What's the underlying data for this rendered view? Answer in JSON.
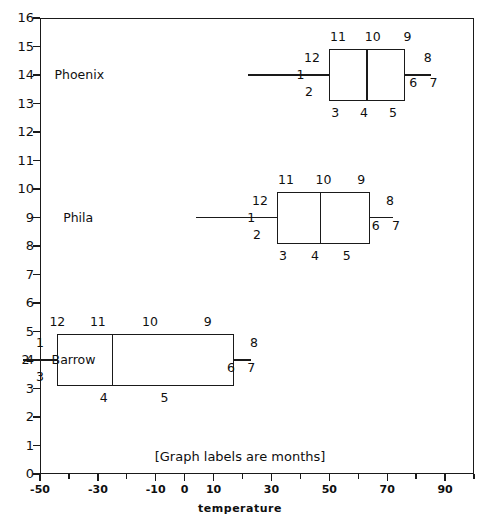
{
  "chart_data": {
    "type": "box",
    "title": "",
    "xlabel": "temperature",
    "ylabel": "",
    "annotation": "[Graph labels are months]",
    "xlim": [
      -50,
      100
    ],
    "ylim": [
      0,
      16
    ],
    "x_major_ticks": [
      -50,
      -30,
      -10,
      0,
      10,
      30,
      50,
      70,
      90
    ],
    "x_major_tick_labels": [
      "-50",
      "-30",
      "-10",
      "0",
      "10",
      "30",
      "50",
      "70",
      "90"
    ],
    "x_minor_ticks": [
      -40,
      -20,
      20,
      40,
      60,
      80,
      100
    ],
    "y_ticks": [
      0,
      1,
      2,
      3,
      4,
      5,
      6,
      7,
      8,
      9,
      10,
      11,
      12,
      13,
      14,
      15,
      16
    ],
    "y_tick_labels": [
      "0",
      "1",
      "2",
      "3",
      "4",
      "5",
      "6",
      "7",
      "8",
      "9",
      "10",
      "11",
      "12",
      "13",
      "14",
      "15",
      "16"
    ],
    "grid": false,
    "legend": "none",
    "series": [
      {
        "name": "Barrow",
        "y": 4,
        "label_x": -46,
        "whisker_low": -56,
        "q1": -44,
        "median": -25,
        "q3": 17,
        "whisker_high": 23,
        "month_labels": {
          "above": [
            {
              "text": "12",
              "x": -44
            },
            {
              "text": "11",
              "x": -30
            },
            {
              "text": "10",
              "x": -12
            },
            {
              "text": "9",
              "x": 8
            }
          ],
          "left": [
            {
              "text": "1",
              "x": -50
            },
            {
              "text": "2",
              "x": -55
            },
            {
              "text": "3",
              "x": -50
            }
          ],
          "right": [
            {
              "text": "8",
              "x": 24
            },
            {
              "text": "6",
              "x": 16
            },
            {
              "text": "7",
              "x": 23
            }
          ],
          "below": [
            {
              "text": "4",
              "x": -28
            },
            {
              "text": "5",
              "x": -7
            }
          ]
        }
      },
      {
        "name": "Phila",
        "y": 9,
        "label_x": -42,
        "whisker_low": 4,
        "q1": 32,
        "median": 47,
        "q3": 64,
        "whisker_high": 72,
        "month_labels": {
          "above": [
            {
              "text": "11",
              "x": 35
            },
            {
              "text": "10",
              "x": 48
            },
            {
              "text": "9",
              "x": 61
            }
          ],
          "left": [
            {
              "text": "12",
              "x": 26
            },
            {
              "text": "1",
              "x": 23
            },
            {
              "text": "2",
              "x": 25
            }
          ],
          "right": [
            {
              "text": "8",
              "x": 71
            },
            {
              "text": "6",
              "x": 66
            },
            {
              "text": "7",
              "x": 73
            }
          ],
          "below": [
            {
              "text": "3",
              "x": 34
            },
            {
              "text": "4",
              "x": 45
            },
            {
              "text": "5",
              "x": 56
            }
          ]
        }
      },
      {
        "name": "Phoenix",
        "y": 14,
        "label_x": -45,
        "whisker_low": 22,
        "q1": 50,
        "median": 63,
        "q3": 76,
        "whisker_high": 85,
        "month_labels": {
          "above": [
            {
              "text": "11",
              "x": 53
            },
            {
              "text": "10",
              "x": 65
            },
            {
              "text": "9",
              "x": 77
            }
          ],
          "left": [
            {
              "text": "12",
              "x": 44
            },
            {
              "text": "1",
              "x": 40
            },
            {
              "text": "2",
              "x": 43
            }
          ],
          "right": [
            {
              "text": "8",
              "x": 84
            },
            {
              "text": "6",
              "x": 79
            },
            {
              "text": "7",
              "x": 86
            }
          ],
          "below": [
            {
              "text": "3",
              "x": 52
            },
            {
              "text": "4",
              "x": 62
            },
            {
              "text": "5",
              "x": 72
            }
          ]
        }
      }
    ]
  }
}
